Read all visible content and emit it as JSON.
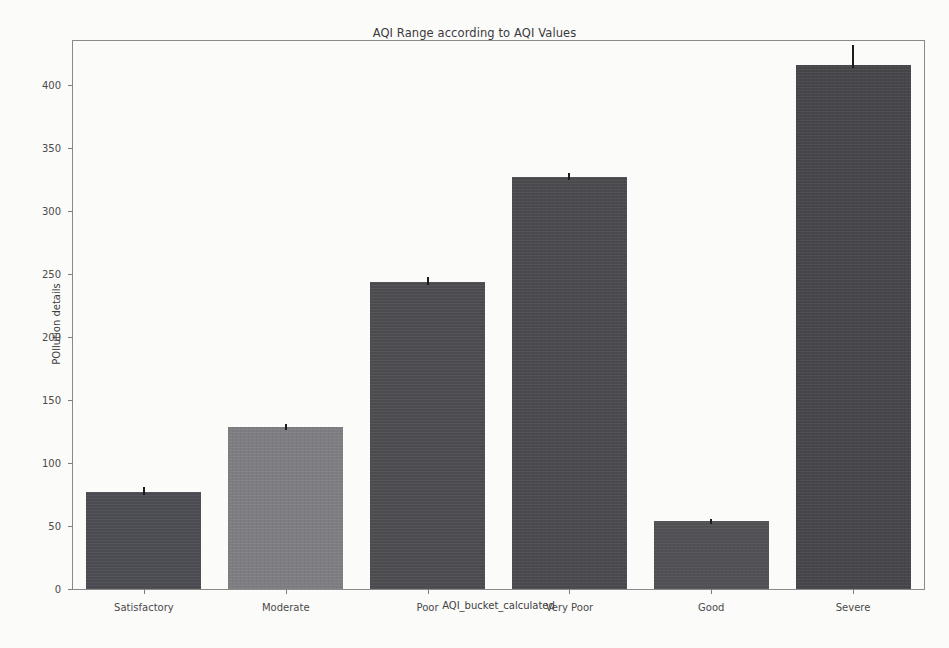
{
  "chart_data": {
    "type": "bar",
    "title": "AQI Range according to AQI Values",
    "xlabel": "AQI_bucket_calculated",
    "ylabel": "POllution details",
    "categories": [
      "Satisfactory",
      "Moderate",
      "Poor",
      "Very Poor",
      "Good",
      "Severe"
    ],
    "values": [
      77,
      129,
      244,
      327,
      54,
      416
    ],
    "errors": [
      3,
      2,
      3,
      3,
      2,
      9
    ],
    "bar_colors": [
      "#4b4b52",
      "#7e7e82",
      "#4c4c50",
      "#4a4a4e",
      "#505055",
      "#45454a"
    ],
    "ylim": [
      0,
      435
    ],
    "yticks": [
      0,
      50,
      100,
      150,
      200,
      250,
      300,
      350,
      400
    ],
    "ytick_labels": [
      "0",
      "50",
      "100",
      "150",
      "200",
      "250",
      "300",
      "350",
      "400"
    ],
    "grid": false,
    "legend": null,
    "background_color": "#fbfbfa",
    "axis_color": "#8a8a8a"
  }
}
